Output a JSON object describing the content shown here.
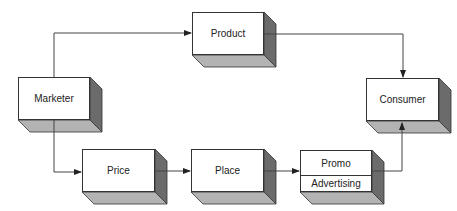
{
  "diagram": {
    "type": "marketing-mix-flow",
    "colors": {
      "front": "#ffffff",
      "side": "#6b6b6b",
      "bottom": "#b3b3b3",
      "stroke": "#333333",
      "line": "#444444"
    },
    "nodes": [
      {
        "id": "product",
        "label": "Product"
      },
      {
        "id": "marketer",
        "label": "Marketer"
      },
      {
        "id": "consumer",
        "label": "Consumer"
      },
      {
        "id": "price",
        "label": "Price"
      },
      {
        "id": "place",
        "label": "Place"
      },
      {
        "id": "promo",
        "label": "Promo",
        "sublabel": "Advertising"
      }
    ],
    "edges": [
      {
        "from": "marketer",
        "to": "product"
      },
      {
        "from": "marketer",
        "to": "price"
      },
      {
        "from": "price",
        "to": "place"
      },
      {
        "from": "place",
        "to": "promo"
      },
      {
        "from": "product",
        "to": "consumer"
      },
      {
        "from": "promo",
        "to": "consumer"
      }
    ]
  }
}
